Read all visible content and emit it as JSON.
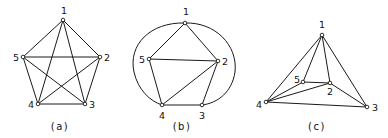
{
  "colors": {
    "line": "#1a1a1a",
    "node_fill": "#ffffff",
    "background": "#ffffff"
  },
  "graphs": [
    {
      "caption": "(a)",
      "caption_pos": [
        60,
        130
      ],
      "nodes": [
        {
          "id": "1",
          "x": 63,
          "y": 20,
          "lx": 61,
          "ly": 14
        },
        {
          "id": "2",
          "x": 100,
          "y": 57,
          "lx": 104,
          "ly": 61
        },
        {
          "id": "3",
          "x": 85,
          "y": 104,
          "lx": 89,
          "ly": 108
        },
        {
          "id": "4",
          "x": 38,
          "y": 104,
          "lx": 28,
          "ly": 108
        },
        {
          "id": "5",
          "x": 23,
          "y": 57,
          "lx": 13,
          "ly": 61
        }
      ],
      "edges": [
        [
          "1",
          "2"
        ],
        [
          "1",
          "3"
        ],
        [
          "1",
          "4"
        ],
        [
          "1",
          "5"
        ],
        [
          "2",
          "3"
        ],
        [
          "2",
          "4"
        ],
        [
          "2",
          "5"
        ],
        [
          "3",
          "4"
        ],
        [
          "3",
          "5"
        ],
        [
          "4",
          "5"
        ]
      ],
      "curves": []
    },
    {
      "caption": "(b)",
      "caption_pos": [
        182,
        130
      ],
      "nodes": [
        {
          "id": "1",
          "x": 185,
          "y": 23,
          "lx": 183,
          "ly": 15
        },
        {
          "id": "2",
          "x": 218,
          "y": 61,
          "lx": 222,
          "ly": 65
        },
        {
          "id": "3",
          "x": 202,
          "y": 105,
          "lx": 199,
          "ly": 119
        },
        {
          "id": "4",
          "x": 162,
          "y": 105,
          "lx": 159,
          "ly": 119
        },
        {
          "id": "5",
          "x": 149,
          "y": 59,
          "lx": 139,
          "ly": 63
        }
      ],
      "edges": [
        [
          "1",
          "5"
        ],
        [
          "1",
          "2"
        ],
        [
          "5",
          "2"
        ],
        [
          "5",
          "4"
        ],
        [
          "4",
          "2"
        ],
        [
          "2",
          "3"
        ],
        [
          "4",
          "3"
        ]
      ],
      "curves": [
        {
          "from": "1",
          "to": "4",
          "d": "M185,23 C150,22 128,45 134,72 C138,90 150,101 162,105"
        },
        {
          "from": "1",
          "to": "3",
          "d": "M185,23 C215,22 238,45 235,72 C232,92 218,103 202,105"
        }
      ]
    },
    {
      "caption": "(c)",
      "caption_pos": [
        317,
        130
      ],
      "nodes": [
        {
          "id": "1",
          "x": 322,
          "y": 35,
          "lx": 319,
          "ly": 28
        },
        {
          "id": "2",
          "x": 330,
          "y": 83,
          "lx": 327,
          "ly": 95
        },
        {
          "id": "3",
          "x": 367,
          "y": 107,
          "lx": 372,
          "ly": 111
        },
        {
          "id": "4",
          "x": 266,
          "y": 102,
          "lx": 256,
          "ly": 108
        },
        {
          "id": "5",
          "x": 303,
          "y": 82,
          "lx": 294,
          "ly": 83
        }
      ],
      "edges": [
        [
          "1",
          "4"
        ],
        [
          "1",
          "5"
        ],
        [
          "1",
          "2"
        ],
        [
          "1",
          "3"
        ],
        [
          "4",
          "5"
        ],
        [
          "4",
          "2"
        ],
        [
          "4",
          "3"
        ],
        [
          "5",
          "2"
        ],
        [
          "2",
          "3"
        ]
      ],
      "curves": []
    }
  ]
}
